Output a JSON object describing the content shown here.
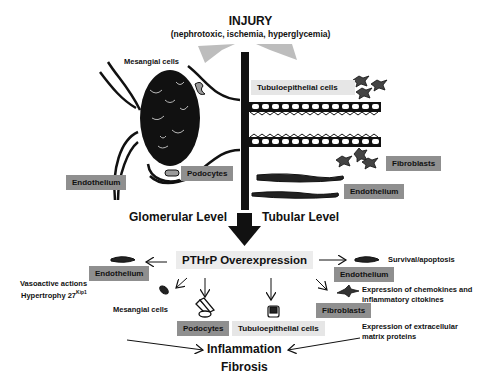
{
  "header": {
    "title": "INJURY",
    "subtitle": "(nephrotoxic, ischemia, hyperglycemia)"
  },
  "glomerular": {
    "level_label": "Glomerular Level",
    "labels": {
      "mesangial": "Mesangial cells",
      "podocytes": "Podocytes",
      "endothelium": "Endothelium"
    }
  },
  "tubular": {
    "level_label": "Tubular Level",
    "labels": {
      "tubuloepithelial": "Tubuloepithelial cells",
      "fibroblasts": "Fibroblasts",
      "endothelium": "Endothelium"
    }
  },
  "center": {
    "title": "PTHrP Overexpression"
  },
  "effects": {
    "endothelium_left": {
      "label": "Endothelium",
      "note_line1": "Vasoactive actions",
      "note_line2": "Hypertrophy 27",
      "note_sup": "Kip1"
    },
    "mesangial": {
      "label": "Mesangial cells"
    },
    "podocytes": {
      "label": "Podocytes"
    },
    "tubuloepithelial": {
      "label": "Tubuloepithelial cells"
    },
    "endothelium_right": {
      "label": "Endothelium",
      "note": "Survival/apoptosis"
    },
    "fibroblasts": {
      "label": "Fibroblasts",
      "note_line1": "Expression of chemokines and",
      "note_line2": "inflammatory citokines",
      "note2_line1": "Expression of extracellular",
      "note2_line2": "matrix proteins"
    }
  },
  "outcome": {
    "line1": "Inflammation",
    "line2": "Fibrosis"
  },
  "colors": {
    "dark_label": "#8f8f8f",
    "light_label": "#e6e6e6",
    "ink": "#111111"
  }
}
